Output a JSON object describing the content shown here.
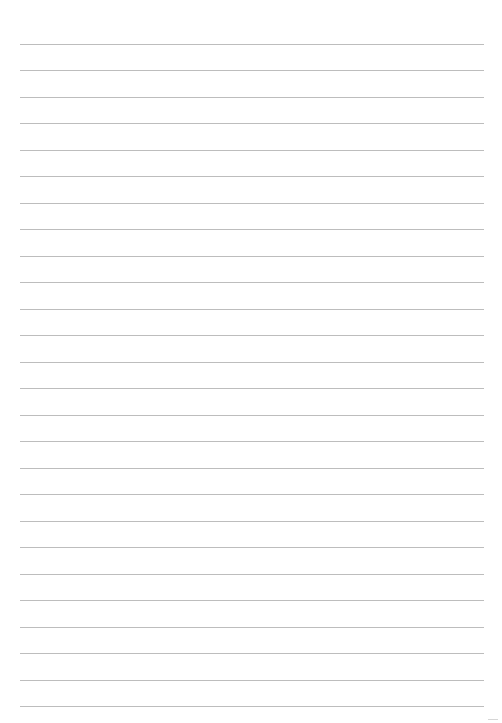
{
  "page": {
    "type": "lined-paper",
    "line_count": 26,
    "first_line_y": 44,
    "line_spacing": 26.48,
    "line_left": 20,
    "line_width": 464,
    "line_color": "#bdbdbd",
    "background": "#ffffff"
  }
}
